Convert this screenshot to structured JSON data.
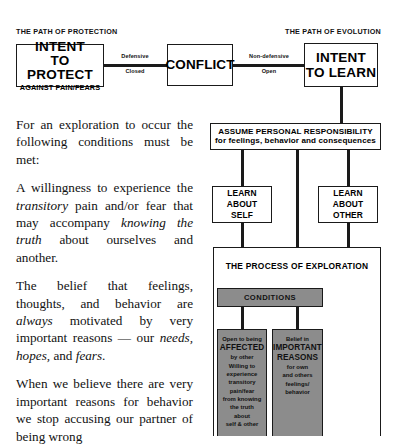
{
  "diagram": {
    "path_labels": {
      "left": "THE PATH OF PROTECTION",
      "right": "THE PATH OF EVOLUTION"
    },
    "protect_box": {
      "line1": "INTENT",
      "line2": "TO PROTECT",
      "line3": "AGAINST PAIN/FEARS"
    },
    "conflict_box": {
      "line1": "CONFLICT"
    },
    "learn_box": {
      "line1": "INTENT",
      "line2": "TO LEARN"
    },
    "edge_left": {
      "above": "Defensive",
      "below": "Closed"
    },
    "edge_right": {
      "above": "Non-defensive",
      "below": "Open"
    },
    "responsibility_box": {
      "line1": "ASSUME PERSONAL RESPONSIBILITY",
      "line2": "for feelings, behavior and consequences"
    },
    "learn_self_box": {
      "line1": "LEARN",
      "line2": "ABOUT",
      "line3": "SELF"
    },
    "learn_other_box": {
      "line1": "LEARN",
      "line2": "ABOUT",
      "line3": "OTHER"
    },
    "exploration": {
      "title": "THE PROCESS OF EXPLORATION",
      "conditions_label": "CONDITIONS",
      "condition_affected": {
        "l1": "Open to being",
        "l2": "AFFECTED",
        "l3": "by other",
        "l4": "Willing to",
        "l5": "experience",
        "l6": "transitory",
        "l7": "pain/fear",
        "l8": "from knowing",
        "l9": "the truth",
        "l10": "about",
        "l11": "self & other"
      },
      "condition_reasons": {
        "l1": "Belief in",
        "l2": "IMPORTANT",
        "l3": "REASONS",
        "l4": "for own",
        "l5": "and others",
        "l6": "feelings/",
        "l7": "behavior"
      }
    },
    "colors": {
      "ink": "#1a1a1a",
      "gray_fill": "#8c8c8c",
      "paper": "#ffffff"
    }
  },
  "body_text": {
    "p1_a": "For an exploration to occur the following conditions must be met:",
    "p2_a": "A willingness to experience the ",
    "p2_i1": "transitory",
    "p2_b": " pain and/or fear that may accompany ",
    "p2_i2": "knowing the truth",
    "p2_c": " about ourselves and another.",
    "p3_a": "The belief that feelings, thoughts, and behavior are ",
    "p3_i1": "always",
    "p3_b": " motivated by very important reasons — our ",
    "p3_i2": "needs, hopes,",
    "p3_c": " and ",
    "p3_i3": "fears",
    "p3_d": ".",
    "p4_a": "When we believe there are very important reasons for behavior we stop accusing our partner of being wrong"
  }
}
